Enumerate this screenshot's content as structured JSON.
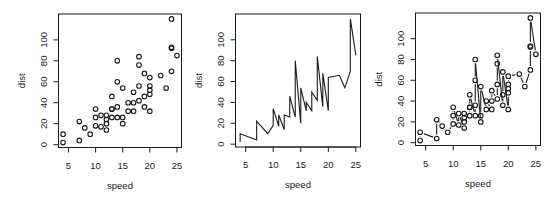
{
  "figure": {
    "panel_count": 3,
    "colors": {
      "ink": "#1a1a1a",
      "background": "#ffffff"
    }
  },
  "chart_data": [
    {
      "type": "scatter",
      "plot_style": "points",
      "title": "",
      "xlabel": "speed",
      "ylabel": "dist",
      "xlim": [
        4,
        25
      ],
      "ylim": [
        2,
        120
      ],
      "xticks": [
        5,
        10,
        15,
        20,
        25
      ],
      "yticks": [
        0,
        20,
        40,
        60,
        80,
        100
      ],
      "grid": false,
      "legend": null,
      "x": [
        4,
        4,
        7,
        7,
        8,
        9,
        10,
        10,
        10,
        11,
        11,
        12,
        12,
        12,
        12,
        13,
        13,
        13,
        13,
        14,
        14,
        14,
        14,
        15,
        15,
        15,
        16,
        16,
        17,
        17,
        17,
        18,
        18,
        18,
        18,
        19,
        19,
        19,
        20,
        20,
        20,
        20,
        20,
        22,
        23,
        24,
        24,
        24,
        24,
        25
      ],
      "y": [
        2,
        10,
        4,
        22,
        16,
        10,
        18,
        26,
        34,
        17,
        28,
        14,
        20,
        24,
        28,
        26,
        34,
        34,
        46,
        26,
        36,
        60,
        80,
        20,
        26,
        54,
        32,
        40,
        32,
        40,
        50,
        42,
        56,
        76,
        84,
        36,
        46,
        68,
        32,
        48,
        52,
        56,
        64,
        66,
        54,
        70,
        92,
        93,
        120,
        85
      ]
    },
    {
      "type": "line",
      "plot_style": "lines",
      "title": "",
      "xlabel": "speed",
      "ylabel": "dist",
      "xlim": [
        4,
        25
      ],
      "ylim": [
        2,
        120
      ],
      "xticks": [
        5,
        10,
        15,
        20,
        25
      ],
      "yticks": [
        0,
        20,
        40,
        60,
        80,
        100
      ],
      "grid": false,
      "legend": null,
      "x": [
        4,
        4,
        7,
        7,
        8,
        9,
        10,
        10,
        10,
        11,
        11,
        12,
        12,
        12,
        12,
        13,
        13,
        13,
        13,
        14,
        14,
        14,
        14,
        15,
        15,
        15,
        16,
        16,
        17,
        17,
        17,
        18,
        18,
        18,
        18,
        19,
        19,
        19,
        20,
        20,
        20,
        20,
        20,
        22,
        23,
        24,
        24,
        24,
        24,
        25
      ],
      "y": [
        2,
        10,
        4,
        22,
        16,
        10,
        18,
        26,
        34,
        17,
        28,
        14,
        20,
        24,
        28,
        26,
        34,
        34,
        46,
        26,
        36,
        60,
        80,
        20,
        26,
        54,
        32,
        40,
        32,
        40,
        50,
        42,
        56,
        76,
        84,
        36,
        46,
        68,
        32,
        48,
        52,
        56,
        64,
        66,
        54,
        70,
        92,
        93,
        120,
        85
      ]
    },
    {
      "type": "line",
      "plot_style": "both",
      "title": "",
      "xlabel": "speed",
      "ylabel": "dist",
      "xlim": [
        4,
        25
      ],
      "ylim": [
        2,
        120
      ],
      "xticks": [
        5,
        10,
        15,
        20,
        25
      ],
      "yticks": [
        0,
        20,
        40,
        60,
        80,
        100
      ],
      "grid": false,
      "legend": null,
      "x": [
        4,
        4,
        7,
        7,
        8,
        9,
        10,
        10,
        10,
        11,
        11,
        12,
        12,
        12,
        12,
        13,
        13,
        13,
        13,
        14,
        14,
        14,
        14,
        15,
        15,
        15,
        16,
        16,
        17,
        17,
        17,
        18,
        18,
        18,
        18,
        19,
        19,
        19,
        20,
        20,
        20,
        20,
        20,
        22,
        23,
        24,
        24,
        24,
        24,
        25
      ],
      "y": [
        2,
        10,
        4,
        22,
        16,
        10,
        18,
        26,
        34,
        17,
        28,
        14,
        20,
        24,
        28,
        26,
        34,
        34,
        46,
        26,
        36,
        60,
        80,
        20,
        26,
        54,
        32,
        40,
        32,
        40,
        50,
        42,
        56,
        76,
        84,
        36,
        46,
        68,
        32,
        48,
        52,
        56,
        64,
        66,
        54,
        70,
        92,
        93,
        120,
        85
      ]
    }
  ]
}
